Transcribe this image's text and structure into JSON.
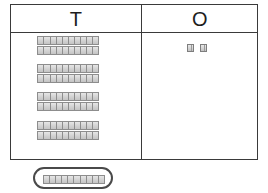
{
  "worksheet": {
    "kind": "place-value-chart",
    "title": "Place Value Chart — Tens and Ones",
    "background_color": "#ffffff",
    "frame_color": "#3a3a3a",
    "block_fill_color": "#d9d9d9",
    "block_border_color": "#8d8d8d",
    "selection_color": "#4a4a4a"
  },
  "table": {
    "columns": [
      {
        "key": "tens",
        "header": "T",
        "header_meaning": "Tens",
        "block_type": "ten-rod",
        "count": 8
      },
      {
        "key": "ones",
        "header": "O",
        "header_meaning": "Ones",
        "block_type": "unit-cube",
        "count": 2
      }
    ]
  },
  "tens_column": {
    "label": "T",
    "rod_count": 8,
    "units_per_rod": 10,
    "total_value": 80,
    "groups": [
      {
        "rods": 2
      },
      {
        "rods": 2
      },
      {
        "rods": 2
      },
      {
        "rods": 2
      }
    ],
    "rods": [
      {
        "index": 1,
        "units": 10,
        "x": 38,
        "y": 37
      },
      {
        "index": 2,
        "units": 10,
        "x": 38,
        "y": 47
      },
      {
        "index": 3,
        "units": 10,
        "x": 38,
        "y": 65
      },
      {
        "index": 4,
        "units": 10,
        "x": 38,
        "y": 75
      },
      {
        "index": 5,
        "units": 10,
        "x": 38,
        "y": 93
      },
      {
        "index": 6,
        "units": 10,
        "x": 38,
        "y": 103
      },
      {
        "index": 7,
        "units": 10,
        "x": 38,
        "y": 122
      },
      {
        "index": 8,
        "units": 10,
        "x": 38,
        "y": 132
      }
    ]
  },
  "ones_column": {
    "label": "O",
    "cube_count": 2,
    "total_value": 2,
    "cubes": [
      {
        "index": 1,
        "units": 1,
        "x": 188,
        "y": 45
      },
      {
        "index": 2,
        "units": 1,
        "x": 201,
        "y": 45
      }
    ]
  },
  "selection": {
    "present": true,
    "shape": "rounded-rectangle",
    "contains": "ten-rod",
    "units": 10,
    "value": 10,
    "position_note": "below the chart"
  },
  "represented_number": {
    "tens": 8,
    "ones": 2,
    "value": 82
  }
}
